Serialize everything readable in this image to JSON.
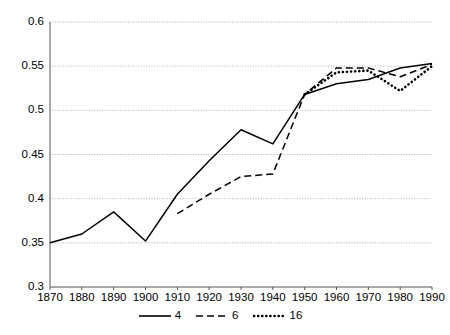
{
  "chart_data": {
    "type": "line",
    "title": "",
    "xlabel": "",
    "ylabel": "",
    "xlim": [
      1870,
      1990
    ],
    "ylim": [
      0.3,
      0.6
    ],
    "grid": true,
    "grid_axis": "y",
    "legend_position": "bottom-center",
    "x_ticks": [
      1870,
      1880,
      1890,
      1900,
      1910,
      1920,
      1930,
      1940,
      1950,
      1960,
      1970,
      1980,
      1990
    ],
    "y_ticks": [
      0.3,
      0.35,
      0.4,
      0.45,
      0.5,
      0.55,
      0.6
    ],
    "x_tick_labels": [
      "1870",
      "1880",
      "1890",
      "1900",
      "1910",
      "1920",
      "1930",
      "1940",
      "1950",
      "1960",
      "1970",
      "1980",
      "1990"
    ],
    "y_tick_labels": [
      "0.3",
      "0.35",
      "0.4",
      "0.45",
      "0.5",
      "0.55",
      "0.6"
    ],
    "series": [
      {
        "name": "4",
        "style": "solid",
        "color": "#000000",
        "x": [
          1870,
          1880,
          1890,
          1900,
          1910,
          1920,
          1930,
          1940,
          1950,
          1960,
          1970,
          1980,
          1990
        ],
        "values": [
          0.35,
          0.36,
          0.385,
          0.352,
          0.405,
          0.443,
          0.478,
          0.462,
          0.518,
          0.53,
          0.535,
          0.548,
          0.553
        ]
      },
      {
        "name": "6",
        "style": "dashed",
        "color": "#000000",
        "x": [
          1910,
          1920,
          1930,
          1940,
          1950,
          1960,
          1970,
          1980,
          1990
        ],
        "values": [
          0.383,
          0.405,
          0.425,
          0.428,
          0.518,
          0.548,
          0.548,
          0.538,
          0.552
        ]
      },
      {
        "name": "16",
        "style": "dotted",
        "color": "#000000",
        "x": [
          1950,
          1960,
          1970,
          1980,
          1990
        ],
        "values": [
          0.518,
          0.543,
          0.545,
          0.522,
          0.55
        ]
      }
    ],
    "legend": [
      {
        "label": "4",
        "style": "solid"
      },
      {
        "label": "6",
        "style": "dashed"
      },
      {
        "label": "16",
        "style": "dotted"
      }
    ]
  }
}
